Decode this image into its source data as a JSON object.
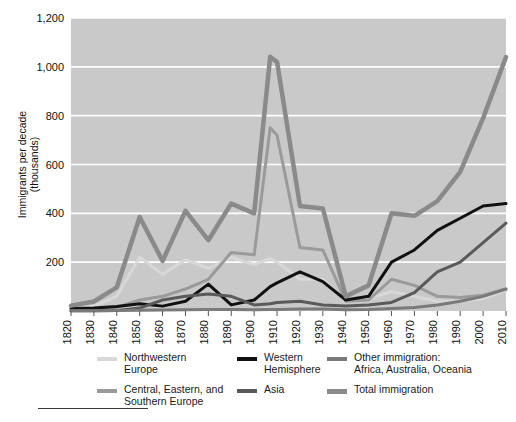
{
  "chart_data": {
    "type": "line",
    "title": "",
    "xlabel": "",
    "ylabel": "Immigrants per decade\n(thousands)",
    "ylabel_line1": "Immigrants per decade",
    "ylabel_line2": "(thousands)",
    "xlim": [
      1820,
      2010
    ],
    "ylim": [
      0,
      1200
    ],
    "yticks": [
      0,
      200,
      400,
      600,
      800,
      1000,
      1200
    ],
    "ytick_labels": [
      "",
      "200",
      "400",
      "600",
      "800",
      "1,000",
      "1,200"
    ],
    "grid": "horizontal",
    "grid_color": "#ffffff",
    "plot_bg": "#c9c9c9",
    "legend_position": "below",
    "x": [
      1820,
      1830,
      1840,
      1850,
      1860,
      1870,
      1880,
      1890,
      1900,
      1907,
      1910,
      1920,
      1930,
      1940,
      1950,
      1960,
      1970,
      1980,
      1990,
      2000,
      2010
    ],
    "xtick_labels": [
      "1820",
      "1830",
      "1840",
      "1850",
      "1860",
      "1870",
      "1880",
      "1890",
      "1900",
      "1910",
      "1920",
      "1930",
      "1940",
      "1950",
      "1960",
      "1970",
      "1980",
      "1990",
      "2000",
      "2010"
    ],
    "series": [
      {
        "name": "Northwestern Europe",
        "color": "#d8d8d8",
        "width": 3,
        "values": [
          8,
          20,
          60,
          220,
          150,
          210,
          175,
          220,
          190,
          215,
          200,
          130,
          130,
          38,
          50,
          80,
          60,
          40,
          40,
          50,
          85
        ]
      },
      {
        "name": "Central, Eastern, and Southern Europe",
        "color": "#9a9a9a",
        "width": 3,
        "values": [
          2,
          5,
          15,
          45,
          60,
          90,
          130,
          240,
          230,
          750,
          720,
          260,
          250,
          40,
          45,
          130,
          105,
          60,
          55,
          65,
          90
        ]
      },
      {
        "name": "Western Hemisphere",
        "color": "#111111",
        "width": 3,
        "values": [
          10,
          12,
          18,
          30,
          20,
          40,
          110,
          25,
          45,
          100,
          115,
          160,
          120,
          45,
          60,
          200,
          250,
          330,
          380,
          430,
          440
        ]
      },
      {
        "name": "Asia",
        "color": "#5a5a5a",
        "width": 3,
        "values": [
          1,
          1,
          2,
          12,
          45,
          60,
          70,
          60,
          25,
          30,
          35,
          40,
          25,
          20,
          25,
          35,
          75,
          160,
          200,
          280,
          360
        ]
      },
      {
        "name": "Other immigration: Africa, Australia, Oceania",
        "color": "#7a7a7a",
        "width": 3,
        "values": [
          1,
          1,
          2,
          3,
          4,
          5,
          6,
          6,
          5,
          6,
          6,
          8,
          8,
          5,
          6,
          10,
          14,
          25,
          40,
          60,
          90
        ]
      },
      {
        "name": "Total immigration",
        "color": "#8a8a8a",
        "width": 4.5,
        "values": [
          22,
          39,
          97,
          385,
          205,
          410,
          290,
          440,
          400,
          1041,
          1020,
          430,
          420,
          60,
          105,
          400,
          390,
          450,
          570,
          790,
          1040
        ]
      }
    ]
  },
  "legend": {
    "columns": [
      {
        "items": [
          {
            "label": "Northwestern\nEurope",
            "color": "#d8d8d8",
            "thick": false
          },
          {
            "label": "Central, Eastern, and\nSouthern Europe",
            "color": "#9a9a9a",
            "thick": false
          }
        ]
      },
      {
        "items": [
          {
            "label": "Western\nHemisphere",
            "color": "#111111",
            "thick": false
          },
          {
            "label": "Asia",
            "color": "#5a5a5a",
            "thick": false
          }
        ]
      },
      {
        "items": [
          {
            "label": "Other immigration:\nAfrica, Australia, Oceania",
            "color": "#7a7a7a",
            "thick": false
          },
          {
            "label": "Total immigration",
            "color": "#8a8a8a",
            "thick": true
          }
        ]
      }
    ]
  }
}
